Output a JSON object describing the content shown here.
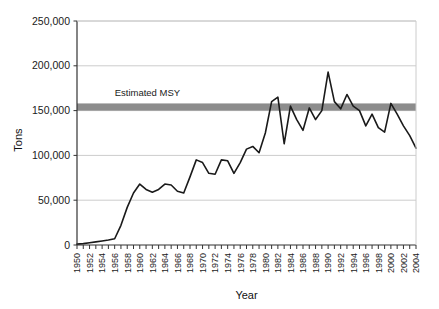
{
  "chart_data": {
    "type": "line",
    "title": "",
    "xlabel": "Year",
    "ylabel": "Tons",
    "xlim": [
      1950,
      2004
    ],
    "ylim": [
      0,
      250000
    ],
    "ytick_values": [
      0,
      50000,
      100000,
      150000,
      200000,
      250000
    ],
    "ytick_labels": [
      "0",
      "50,000",
      "100,000",
      "150,000",
      "200,000",
      "250,000"
    ],
    "xtick_labels": [
      "1950",
      "1952",
      "1954",
      "1956",
      "1958",
      "1960",
      "1962",
      "1964",
      "1966",
      "1968",
      "1970",
      "1972",
      "1974",
      "1976",
      "1978",
      "1980",
      "1982",
      "1984",
      "1986",
      "1988",
      "1990",
      "1992",
      "1994",
      "1996",
      "1998",
      "2000",
      "2002",
      "2004"
    ],
    "xtick_step_years": 2,
    "minor_tick_step_years": 1,
    "grid": "horizontal",
    "legend": "none",
    "line_color": "#1a1a1a",
    "line_width": 1.6,
    "x": [
      1950,
      1951,
      1952,
      1953,
      1954,
      1955,
      1956,
      1957,
      1958,
      1959,
      1960,
      1961,
      1962,
      1963,
      1964,
      1965,
      1966,
      1967,
      1968,
      1969,
      1970,
      1971,
      1972,
      1973,
      1974,
      1975,
      1976,
      1977,
      1978,
      1979,
      1980,
      1981,
      1982,
      1983,
      1984,
      1985,
      1986,
      1987,
      1988,
      1989,
      1990,
      1991,
      1992,
      1993,
      1994,
      1995,
      1996,
      1997,
      1998,
      1999,
      2000,
      2001,
      2002,
      2003,
      2004
    ],
    "values": [
      1000,
      1500,
      2500,
      3500,
      4500,
      5500,
      7000,
      22000,
      42000,
      58000,
      68000,
      62000,
      59000,
      62000,
      68000,
      67000,
      60000,
      58000,
      76000,
      95000,
      92000,
      80000,
      79000,
      95000,
      94000,
      80000,
      92000,
      107000,
      110000,
      103000,
      125000,
      160000,
      165000,
      113000,
      155000,
      140000,
      128000,
      153000,
      140000,
      150000,
      193000,
      160000,
      152000,
      168000,
      155000,
      150000,
      133000,
      146000,
      131000,
      126000,
      158000,
      146000,
      133000,
      122000,
      108000
    ],
    "annotations": [
      {
        "name": "estimated-msy-band",
        "label": "Estimated MSY",
        "type": "hband",
        "y_low": 150000,
        "y_high": 158000,
        "color": "#8c8c8c",
        "label_x": 1956,
        "label_y": 166000
      }
    ],
    "axis_color": "#333333",
    "grid_color": "#cccccc",
    "plot_background": "#ffffff"
  }
}
